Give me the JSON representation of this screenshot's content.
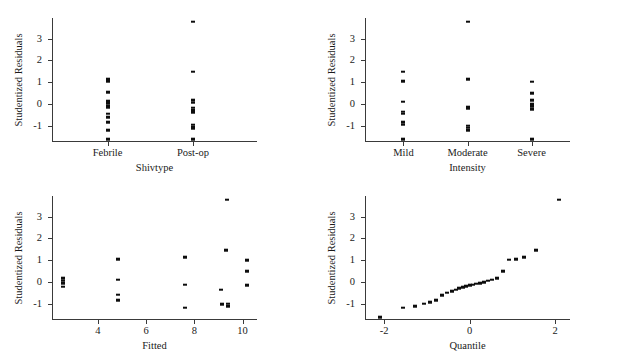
{
  "figure": {
    "background": "#ffffff",
    "marker_color": "#0d0d0d",
    "axis_color": "#3a3a3a",
    "shared_ylabel": "Studentized Residuals"
  },
  "chart_data": [
    {
      "type": "scatter",
      "name": "residuals-by-shivtype",
      "title": "",
      "xlabel": "Shivtype",
      "ylabel": "Studentized Residuals",
      "grid": false,
      "legend": "none",
      "categorical_x": true,
      "categories": [
        "Febrile",
        "Post-op"
      ],
      "xticklabels": [
        "Febrile",
        "Post-op"
      ],
      "yticklabels": [
        "-1",
        "0",
        "1",
        "2",
        "3"
      ],
      "yticks": [
        -1,
        0,
        1,
        2,
        3
      ],
      "ylim": [
        -1.75,
        3.95
      ],
      "xlim": [
        0.35,
        2.75
      ],
      "series": [
        {
          "name": "Febrile",
          "x": [
            1,
            1,
            1,
            1,
            1,
            1,
            1,
            1,
            1,
            1,
            1,
            1
          ],
          "y": [
            1.15,
            1.05,
            0.55,
            0.12,
            0.02,
            -0.1,
            -0.18,
            -0.45,
            -0.62,
            -0.85,
            -1.2,
            -1.62
          ]
        },
        {
          "name": "Post-op",
          "x": [
            2,
            2,
            2,
            2,
            2,
            2,
            2,
            2,
            2,
            2,
            2
          ],
          "y": [
            3.78,
            1.48,
            0.18,
            0.05,
            -0.18,
            -0.3,
            -0.38,
            -0.95,
            -1.05,
            -1.12,
            -1.62
          ]
        }
      ]
    },
    {
      "type": "scatter",
      "name": "residuals-by-intensity",
      "title": "",
      "xlabel": "Intensity",
      "ylabel": "Studentized Residuals",
      "grid": false,
      "legend": "none",
      "categorical_x": true,
      "categories": [
        "Mild",
        "Moderate",
        "Severe"
      ],
      "xticklabels": [
        "Mild",
        "Moderate",
        "Severe"
      ],
      "yticklabels": [
        "-1",
        "0",
        "1",
        "2",
        "3"
      ],
      "yticks": [
        -1,
        0,
        1,
        2,
        3
      ],
      "ylim": [
        -1.75,
        3.95
      ],
      "xlim": [
        0.4,
        3.6
      ],
      "series": [
        {
          "name": "Mild",
          "x": [
            1,
            1,
            1,
            1,
            1,
            1,
            1,
            1
          ],
          "y": [
            1.48,
            1.05,
            0.1,
            -0.35,
            -0.45,
            -0.85,
            -0.95,
            -1.62
          ]
        },
        {
          "name": "Moderate",
          "x": [
            2,
            2,
            2,
            2,
            2,
            2,
            2
          ],
          "y": [
            3.78,
            1.15,
            -0.12,
            -0.2,
            -1.0,
            -1.1,
            -1.2
          ]
        },
        {
          "name": "Severe",
          "x": [
            3,
            3,
            3,
            3,
            3,
            3,
            3
          ],
          "y": [
            1.02,
            0.5,
            0.18,
            0.0,
            -0.1,
            -0.25,
            -1.62
          ]
        }
      ]
    },
    {
      "type": "scatter",
      "name": "residuals-vs-fitted",
      "title": "",
      "xlabel": "Fitted",
      "ylabel": "Studentized Residuals",
      "grid": false,
      "legend": "none",
      "categorical_x": false,
      "xticklabels": [
        "4",
        "6",
        "8",
        "10"
      ],
      "xticks": [
        4,
        6,
        8,
        10
      ],
      "yticklabels": [
        "-1",
        "0",
        "1",
        "2",
        "3"
      ],
      "yticks": [
        -1,
        0,
        1,
        2,
        3
      ],
      "xlim": [
        2.1,
        10.6
      ],
      "ylim": [
        -1.75,
        3.95
      ],
      "x": [
        2.55,
        2.55,
        2.55,
        2.55,
        4.85,
        4.85,
        4.85,
        4.85,
        7.6,
        7.6,
        7.6,
        9.35,
        9.3,
        9.1,
        9.15,
        9.4,
        9.4,
        10.2,
        10.2,
        10.2
      ],
      "y": [
        0.18,
        0.05,
        -0.05,
        -0.22,
        1.05,
        0.1,
        -0.58,
        -0.85,
        1.15,
        -0.12,
        -1.18,
        3.78,
        1.45,
        -0.35,
        -1.02,
        -1.0,
        -1.12,
        1.0,
        0.48,
        -0.15
      ]
    },
    {
      "type": "scatter",
      "name": "normal-qq-plot",
      "title": "",
      "xlabel": "Quantile",
      "ylabel": "Studentized Residuals",
      "grid": false,
      "legend": "none",
      "categorical_x": false,
      "xticklabels": [
        "-2",
        "0",
        "2"
      ],
      "xticks": [
        -2,
        0,
        2
      ],
      "yticklabels": [
        "-1",
        "0",
        "1",
        "2",
        "3"
      ],
      "yticks": [
        -1,
        0,
        1,
        2,
        3
      ],
      "xlim": [
        -2.45,
        2.35
      ],
      "ylim": [
        -1.75,
        3.95
      ],
      "x": [
        -2.1,
        -1.55,
        -1.28,
        -1.08,
        -0.92,
        -0.78,
        -0.64,
        -0.52,
        -0.42,
        -0.33,
        -0.24,
        -0.16,
        -0.08,
        0.0,
        0.08,
        0.16,
        0.24,
        0.33,
        0.42,
        0.52,
        0.64,
        0.78,
        0.92,
        1.08,
        1.28,
        1.55,
        2.1
      ],
      "y": [
        -1.62,
        -1.18,
        -1.12,
        -1.0,
        -0.92,
        -0.85,
        -0.62,
        -0.5,
        -0.42,
        -0.35,
        -0.3,
        -0.25,
        -0.2,
        -0.15,
        -0.12,
        -0.08,
        -0.05,
        0.0,
        0.05,
        0.1,
        0.18,
        0.5,
        1.02,
        1.05,
        1.15,
        1.45,
        3.78
      ]
    }
  ]
}
